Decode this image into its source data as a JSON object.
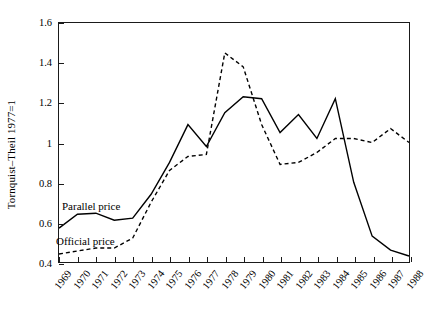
{
  "chart_data": {
    "type": "line",
    "title": "",
    "xlabel": "",
    "ylabel": "Tornquist–Theil 1977=1",
    "xlim": [
      1969,
      1988
    ],
    "ylim": [
      0.4,
      1.6
    ],
    "yticks": [
      0.4,
      0.6,
      0.8,
      1,
      1.2,
      1.4,
      1.6
    ],
    "ytick_labels": [
      "0.4",
      "0.6",
      "0.8",
      "1",
      "1.2",
      "1.4",
      "1.6"
    ],
    "grid": false,
    "legend_position": "inline-annotation",
    "x": [
      1969,
      1970,
      1971,
      1972,
      1973,
      1974,
      1975,
      1976,
      1977,
      1978,
      1979,
      1980,
      1981,
      1982,
      1983,
      1984,
      1985,
      1986,
      1987,
      1988
    ],
    "categories": [
      "1969",
      "1970",
      "1971",
      "1972",
      "1973",
      "1974",
      "1975",
      "1976",
      "1977",
      "1978",
      "1979",
      "1980",
      "1981",
      "1982",
      "1983",
      "1984",
      "1985",
      "1986",
      "1987",
      "1988"
    ],
    "series": [
      {
        "name": "Parallel price",
        "style": "solid",
        "color": "#000000",
        "values": [
          0.57,
          0.64,
          0.645,
          0.61,
          0.62,
          0.74,
          0.9,
          1.09,
          0.98,
          1.15,
          1.23,
          1.22,
          1.05,
          1.14,
          1.02,
          1.22,
          0.8,
          0.53,
          0.46,
          0.43
        ]
      },
      {
        "name": "Official price",
        "style": "dashed",
        "color": "#000000",
        "values": [
          0.44,
          0.455,
          0.47,
          0.47,
          0.52,
          0.7,
          0.86,
          0.93,
          0.94,
          1.45,
          1.38,
          1.09,
          0.89,
          0.9,
          0.95,
          1.02,
          1.02,
          1.0,
          1.07,
          1.0
        ]
      }
    ],
    "annotations": [
      {
        "text": "Parallel price",
        "x": 1969.2,
        "y": 0.7
      },
      {
        "text": "Official price",
        "x": 1969.0,
        "y": 0.53
      }
    ]
  }
}
